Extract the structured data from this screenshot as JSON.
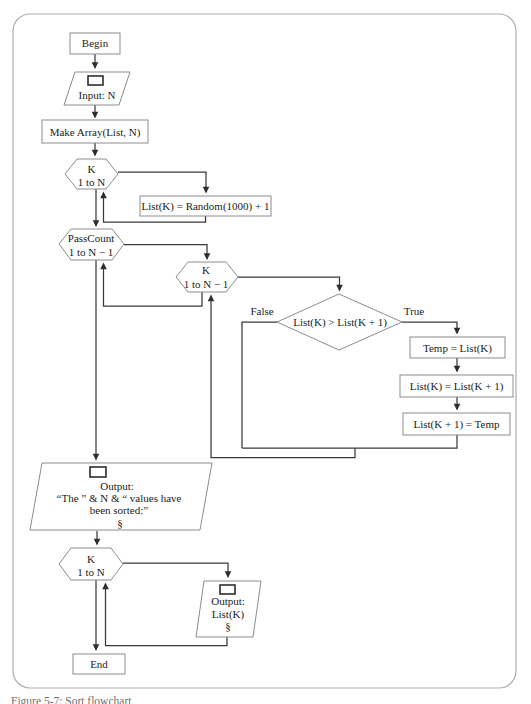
{
  "figure": {
    "caption": "Figure 5-7: Sort flowchart",
    "style": {
      "ink": "#3a3a3a",
      "shape_stroke": "#8c8c8c",
      "frame_stroke": "#adadad",
      "text": "#1b1b1b"
    }
  },
  "labels": {
    "true": "True",
    "false": "False"
  },
  "nodes": {
    "begin": {
      "label": "Begin"
    },
    "input_n": {
      "icon": "display-icon",
      "label": "Input: N"
    },
    "make_array": {
      "label": "Make Array(List, N)"
    },
    "loop_fill": {
      "line1": "K",
      "line2": "1 to N"
    },
    "fill_assign": {
      "label": "List(K) = Random(1000) + 1"
    },
    "loop_pass": {
      "line1": "PassCount",
      "line2": "1 to N − 1"
    },
    "loop_compare": {
      "line1": "K",
      "line2": "1 to N − 1"
    },
    "decision": {
      "label": "List(K) > List(K + 1)"
    },
    "swap_temp": {
      "label": "Temp = List(K)"
    },
    "swap_assign": {
      "label": "List(K) = List(K + 1)"
    },
    "swap_restore": {
      "label": "List(K + 1) = Temp"
    },
    "output_sorted": {
      "icon": "display-icon",
      "line1": "Output:",
      "line2": "“The ” & N & “ values have",
      "line3": "been sorted:”",
      "line4": "§"
    },
    "loop_print": {
      "line1": "K",
      "line2": "1 to N"
    },
    "output_item": {
      "icon": "display-icon",
      "line1": "Output:",
      "line2": "List(K)",
      "line3": "§"
    },
    "end": {
      "label": "End"
    }
  }
}
